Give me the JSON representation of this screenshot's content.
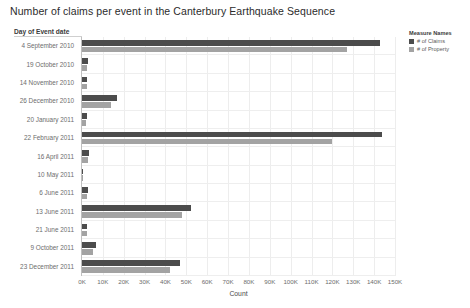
{
  "title": "Number of claims per event in the Canterbury Earthquake Sequence",
  "axis_header": "Day of Event date",
  "legend": {
    "title": "Measure Names",
    "items": [
      {
        "label": "# of Claims",
        "color": "#4c4c4c"
      },
      {
        "label": "# of Property",
        "color": "#a3a3a3"
      }
    ]
  },
  "chart_data": {
    "type": "bar",
    "orientation": "horizontal",
    "title": "Number of claims per event in the Canterbury Earthquake Sequence",
    "xlabel": "Count",
    "ylabel": "Day of Event date",
    "xlim": [
      0,
      150000
    ],
    "xticks": [
      0,
      10000,
      20000,
      30000,
      40000,
      50000,
      60000,
      70000,
      80000,
      90000,
      100000,
      110000,
      120000,
      130000,
      140000,
      150000
    ],
    "xtick_labels": [
      "0K",
      "10K",
      "20K",
      "30K",
      "40K",
      "50K",
      "60K",
      "70K",
      "80K",
      "90K",
      "100K",
      "110K",
      "120K",
      "130K",
      "140K",
      "150K"
    ],
    "grid": true,
    "legend_position": "right",
    "categories": [
      "4 September 2010",
      "19 October 2010",
      "14 November 2010",
      "26 December 2010",
      "20 January 2011",
      "22 February 2011",
      "16 April 2011",
      "10 May 2011",
      "6 June 2011",
      "13 June 2011",
      "21 June 2011",
      "9 October 2011",
      "23 December 2011"
    ],
    "series": [
      {
        "name": "# of Claims",
        "color": "#4c4c4c",
        "values": [
          143000,
          3000,
          2600,
          17000,
          2400,
          144000,
          3200,
          700,
          2800,
          52000,
          2600,
          6500,
          47000
        ]
      },
      {
        "name": "# of Property",
        "color": "#a3a3a3",
        "values": [
          127000,
          2600,
          2200,
          14000,
          2000,
          120000,
          2700,
          500,
          2300,
          48000,
          2200,
          5200,
          42000
        ]
      }
    ]
  }
}
